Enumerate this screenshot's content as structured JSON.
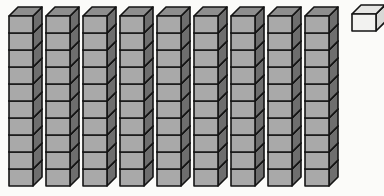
{
  "figure": {
    "kind": "base-ten-blocks",
    "background_color": "#fbfbf9",
    "total_value": 91
  },
  "palette": {
    "rod_face_fill": "#a9a9a9",
    "rod_top_fill": "#8e8e8e",
    "rod_side_fill": "#6e6e6e",
    "unit_face_fill": "#f2f2f0",
    "unit_top_fill": "#e6e6e4",
    "unit_side_fill": "#d8d8d6",
    "outline_color": "#141414",
    "outline_width": 1.6
  },
  "geometry": {
    "cell_width": 24,
    "cell_height": 17,
    "depth_x": 9,
    "depth_y": 9,
    "rod_pitch": 37,
    "rod_origin_x": 9,
    "rod_origin_y": 16,
    "cubes_per_rod": 10
  },
  "groups": [
    {
      "name": "tens-rods",
      "label": "Tens rods",
      "count": 9,
      "cubes_each": 10,
      "value_each": 10,
      "value_total": 90,
      "fill_style": "gray",
      "rods": [
        {
          "name": "rod-1",
          "index": 1,
          "x": 9,
          "value": 10
        },
        {
          "name": "rod-2",
          "index": 2,
          "x": 46,
          "value": 10
        },
        {
          "name": "rod-3",
          "index": 3,
          "x": 83,
          "value": 10
        },
        {
          "name": "rod-4",
          "index": 4,
          "x": 120,
          "value": 10
        },
        {
          "name": "rod-5",
          "index": 5,
          "x": 157,
          "value": 10
        },
        {
          "name": "rod-6",
          "index": 6,
          "x": 194,
          "value": 10
        },
        {
          "name": "rod-7",
          "index": 7,
          "x": 231,
          "value": 10
        },
        {
          "name": "rod-8",
          "index": 8,
          "x": 268,
          "value": 10
        },
        {
          "name": "rod-9",
          "index": 9,
          "x": 305,
          "value": 10
        }
      ]
    },
    {
      "name": "ones-units",
      "label": "Ones unit",
      "count": 1,
      "value_each": 1,
      "value_total": 1,
      "fill_style": "white",
      "units": [
        {
          "name": "unit-cube-1",
          "index": 1,
          "x": 352,
          "y": 14,
          "value": 1
        }
      ]
    }
  ]
}
